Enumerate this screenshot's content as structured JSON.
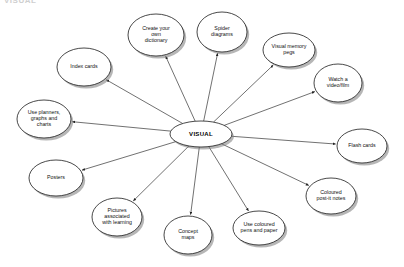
{
  "header": {
    "text": "VISUAL"
  },
  "diagram": {
    "type": "spider-diagram",
    "center": {
      "label": "VISUAL",
      "cx": 201,
      "cy": 134,
      "rx": 31,
      "ry": 13
    },
    "style": {
      "node_fill": "#ffffff",
      "node_stroke": "#1a1a1a",
      "shadow_color": "#7a7a7a",
      "edge_color": "#333333",
      "background": "#ffffff",
      "text_color": "#111111"
    },
    "nodes": [
      {
        "id": "create-dictionary",
        "lines": [
          "Create your",
          "own",
          "dictionary"
        ],
        "cx": 156,
        "cy": 35,
        "rx": 28,
        "ry": 21
      },
      {
        "id": "spider-diagrams",
        "lines": [
          "Spider",
          "diagrams"
        ],
        "cx": 222,
        "cy": 32,
        "rx": 25,
        "ry": 20
      },
      {
        "id": "visual-memory-pegs",
        "lines": [
          "Visual memory",
          "pegs"
        ],
        "cx": 289,
        "cy": 50,
        "rx": 26,
        "ry": 17
      },
      {
        "id": "watch-video-film",
        "lines": [
          "Watch a",
          "video/film"
        ],
        "cx": 338,
        "cy": 83,
        "rx": 24,
        "ry": 19
      },
      {
        "id": "flash-cards",
        "lines": [
          "Flash cards"
        ],
        "cx": 362,
        "cy": 146,
        "rx": 25,
        "ry": 17
      },
      {
        "id": "coloured-post-it-notes",
        "lines": [
          "Coloured",
          "post-it notes"
        ],
        "cx": 331,
        "cy": 196,
        "rx": 25,
        "ry": 18
      },
      {
        "id": "use-coloured-pens-paper",
        "lines": [
          "Use coloured",
          "pens and paper"
        ],
        "cx": 259,
        "cy": 228,
        "rx": 26,
        "ry": 17
      },
      {
        "id": "concept-maps",
        "lines": [
          "Concept",
          "maps"
        ],
        "cx": 188,
        "cy": 235,
        "rx": 24,
        "ry": 19
      },
      {
        "id": "pictures-associated-learning",
        "lines": [
          "Pictures",
          "associated",
          "with learning"
        ],
        "cx": 117,
        "cy": 217,
        "rx": 25,
        "ry": 19
      },
      {
        "id": "posters",
        "lines": [
          "Posters"
        ],
        "cx": 56,
        "cy": 178,
        "rx": 27,
        "ry": 18
      },
      {
        "id": "use-planners-graphs-charts",
        "lines": [
          "Use planners,",
          "graphs and",
          "charts"
        ],
        "cx": 44,
        "cy": 119,
        "rx": 27,
        "ry": 19
      },
      {
        "id": "index-cards",
        "lines": [
          "Index cards"
        ],
        "cx": 84,
        "cy": 67,
        "rx": 27,
        "ry": 19
      }
    ]
  }
}
